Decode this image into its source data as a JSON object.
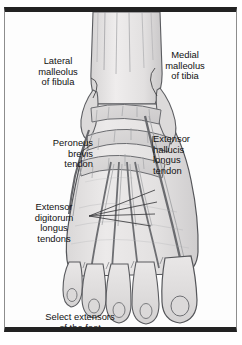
{
  "figure": {
    "title_fragment": "FOOT TENDONS",
    "caption": "Select extensors\nof the foot",
    "view": "dorsal view of right foot and ankle"
  },
  "labels": [
    {
      "id": "lateral-malleolus-of-fibula",
      "text": "Lateral\nmalleolus\nof fibula"
    },
    {
      "id": "medial-malleolus-of-tibia",
      "text": "Medial\nmalleolus\nof tibia"
    },
    {
      "id": "peroneus-brevis-tendon",
      "text": "Peroneus\nbrevis\ntendon"
    },
    {
      "id": "extensor-hallucis-longus-tendon",
      "text": "Extensor\nhallucis\nlongus\ntendon"
    },
    {
      "id": "extensor-digitorum-longus-tendons",
      "text": "Extensor\ndigitorum\nlongus\ntendons"
    }
  ],
  "colors": {
    "frame_dark": "#222222",
    "frame_thin": "#8d8d8d",
    "page_background": "#ffffff",
    "plate_background": "#fdfdfd",
    "skin_fill": "#e4e2e1",
    "skin_shade": "#d2d0d0",
    "outline": "#55565a",
    "ink": "#111111",
    "leader_line": "#3c3c3e"
  }
}
